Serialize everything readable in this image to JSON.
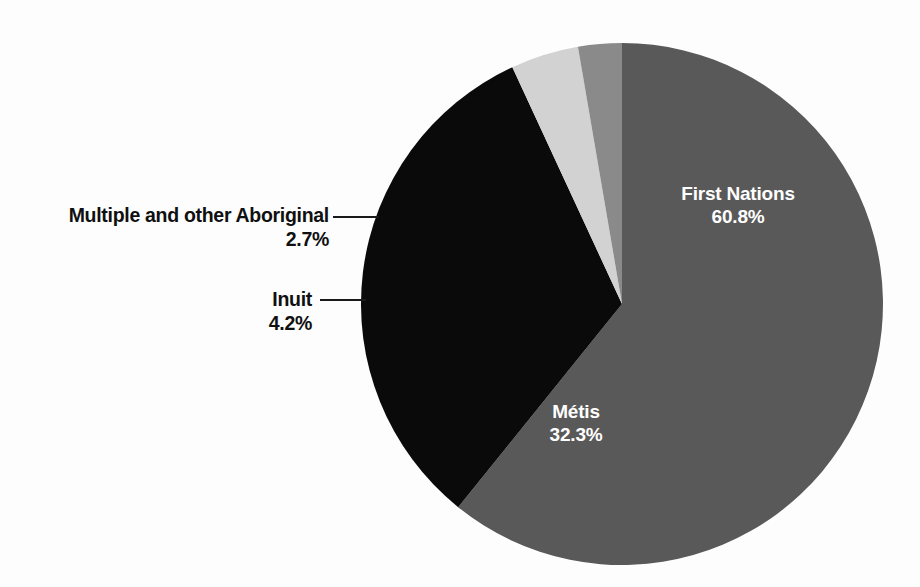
{
  "chart_data": {
    "type": "pie",
    "title": "",
    "subtitle": "",
    "xlabel": "",
    "ylabel": "",
    "legend_position": "none",
    "grid": false,
    "unit": "%",
    "categories": [
      "First Nations",
      "Métis",
      "Inuit",
      "Multiple and other Aboriginal"
    ],
    "values": [
      60.8,
      32.3,
      4.2,
      2.7
    ],
    "slices": [
      {
        "label": "First Nations",
        "value": 60.8,
        "value_text": "60.8%",
        "color": "#595959",
        "label_placement": "inside",
        "label_color": "#ffffff"
      },
      {
        "label": "Métis",
        "value": 32.3,
        "value_text": "32.3%",
        "color": "#0a0a0a",
        "label_placement": "inside",
        "label_color": "#ffffff"
      },
      {
        "label": "Inuit",
        "value": 4.2,
        "value_text": "4.2%",
        "color": "#d2d2d2",
        "label_placement": "outside",
        "label_color": "#101010"
      },
      {
        "label": "Multiple and other Aboriginal",
        "value": 2.7,
        "value_text": "2.7%",
        "color": "#8a8a8a",
        "label_placement": "outside",
        "label_color": "#101010"
      }
    ],
    "start_angle_deg": 0,
    "direction": "clockwise",
    "background_color": "#fdfdfd"
  }
}
